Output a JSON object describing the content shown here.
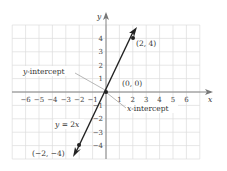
{
  "chart_data": {
    "type": "line",
    "title": "",
    "xlabel": "x",
    "ylabel": "y",
    "xlim": [
      -7,
      7
    ],
    "ylim": [
      -5,
      5
    ],
    "grid": true,
    "x_ticks": [
      "−6",
      "−5",
      "−4",
      "−3",
      "−2",
      "−1",
      "1",
      "2",
      "3",
      "4",
      "5",
      "6"
    ],
    "x_tick_values": [
      -6,
      -5,
      -4,
      -3,
      -2,
      -1,
      1,
      2,
      3,
      4,
      5,
      6
    ],
    "y_ticks": [
      "4",
      "3",
      "2",
      "1",
      "−1",
      "−2",
      "−3",
      "−4"
    ],
    "y_tick_values": [
      4,
      3,
      2,
      1,
      -1,
      -2,
      -3,
      -4
    ],
    "series": [
      {
        "name": "y = 2x",
        "x": [
          -2.2,
          2.2
        ],
        "y": [
          -4.4,
          4.4
        ]
      }
    ],
    "points": [
      {
        "label": "(2, 4)",
        "x": 2,
        "y": 4
      },
      {
        "label": "(0, 0)",
        "x": 0,
        "y": 0
      },
      {
        "label": "(−2, −4)",
        "x": -2,
        "y": -4
      }
    ],
    "annotations": [
      {
        "text": "y-intercept",
        "target": [
          0,
          0
        ]
      },
      {
        "text": "x-intercept",
        "target": [
          0,
          0
        ]
      },
      {
        "text": "y = 2x",
        "target": "line"
      }
    ]
  },
  "labels": {
    "x_axis": "x",
    "y_axis": "y",
    "equation_var": "y",
    "equation_rest": " = 2",
    "equation_x": "x",
    "point_2_4": "(2, 4)",
    "point_0_0": "(0, 0)",
    "point_m2_m4": "(−2, −4)",
    "y_intercept_var": "y",
    "y_intercept_rest": "-intercept",
    "x_intercept_var": "x",
    "x_intercept_rest": "-intercept"
  }
}
